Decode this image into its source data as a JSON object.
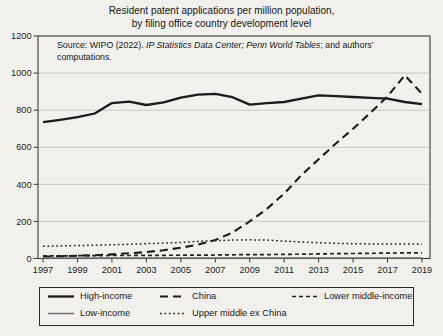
{
  "figure": {
    "title_line1": "Resident patent applications per million population,",
    "title_line2": "by filing office country development level",
    "source_note": {
      "prefix": "Source: WIPO (2022). ",
      "italic": "IP Statistics Data Center; Penn World Tables",
      "suffix": "; and authors'",
      "line2": "computations."
    }
  },
  "chart_data": {
    "type": "line",
    "title": "Resident patent applications per million population, by filing office country development level",
    "xlabel": "",
    "ylabel": "",
    "x": [
      1997,
      1998,
      1999,
      2000,
      2001,
      2002,
      2003,
      2004,
      2005,
      2006,
      2007,
      2008,
      2009,
      2010,
      2011,
      2012,
      2013,
      2014,
      2015,
      2016,
      2017,
      2018,
      2019
    ],
    "xticks": [
      1997,
      1999,
      2001,
      2003,
      2005,
      2007,
      2009,
      2011,
      2013,
      2015,
      2017,
      2019
    ],
    "ylim": [
      0,
      1200
    ],
    "yticks": [
      0,
      200,
      400,
      600,
      800,
      1000,
      1200
    ],
    "grid": "horizontal",
    "grid_color": "#c8c7c3",
    "frame_color": "#3b3b3b",
    "series": [
      {
        "name": "High-income",
        "line_style": "solid",
        "color": "#1b1b1b",
        "width": 2.3,
        "values": [
          735,
          748,
          762,
          782,
          838,
          846,
          828,
          842,
          868,
          884,
          888,
          870,
          830,
          838,
          844,
          862,
          880,
          876,
          871,
          866,
          862,
          844,
          832
        ]
      },
      {
        "name": "China",
        "line_style": "long-dash",
        "color": "#1b1b1b",
        "width": 2.1,
        "values": [
          10,
          12,
          15,
          18,
          22,
          28,
          35,
          45,
          58,
          75,
          100,
          140,
          200,
          268,
          350,
          450,
          535,
          620,
          700,
          785,
          875,
          988,
          888
        ]
      },
      {
        "name": "Lower middle-income",
        "line_style": "short-dash",
        "color": "#222222",
        "width": 1.7,
        "values": [
          14,
          14,
          15,
          15,
          16,
          16,
          17,
          17,
          18,
          18,
          19,
          20,
          21,
          21,
          22,
          23,
          25,
          26,
          27,
          28,
          29,
          30,
          30
        ]
      },
      {
        "name": "Low-income",
        "line_style": "solid",
        "color": "#707070",
        "width": 1.5,
        "values": [
          3,
          3,
          3,
          3,
          3,
          3,
          3,
          3,
          3,
          3,
          3,
          3,
          3,
          3,
          3,
          3,
          3,
          3,
          3,
          3,
          3,
          3,
          3
        ]
      },
      {
        "name": "Upper middle ex China",
        "line_style": "dotted",
        "color": "#2a2a2a",
        "width": 1.5,
        "values": [
          66,
          68,
          70,
          72,
          74,
          77,
          80,
          83,
          87,
          92,
          96,
          99,
          101,
          99,
          94,
          89,
          85,
          82,
          80,
          79,
          78,
          79,
          77
        ]
      }
    ],
    "legend": {
      "position": "bottom-box",
      "rows": [
        [
          "High-income",
          "China",
          "Lower middle-income"
        ],
        [
          "Low-income",
          "Upper middle ex China"
        ]
      ]
    }
  }
}
